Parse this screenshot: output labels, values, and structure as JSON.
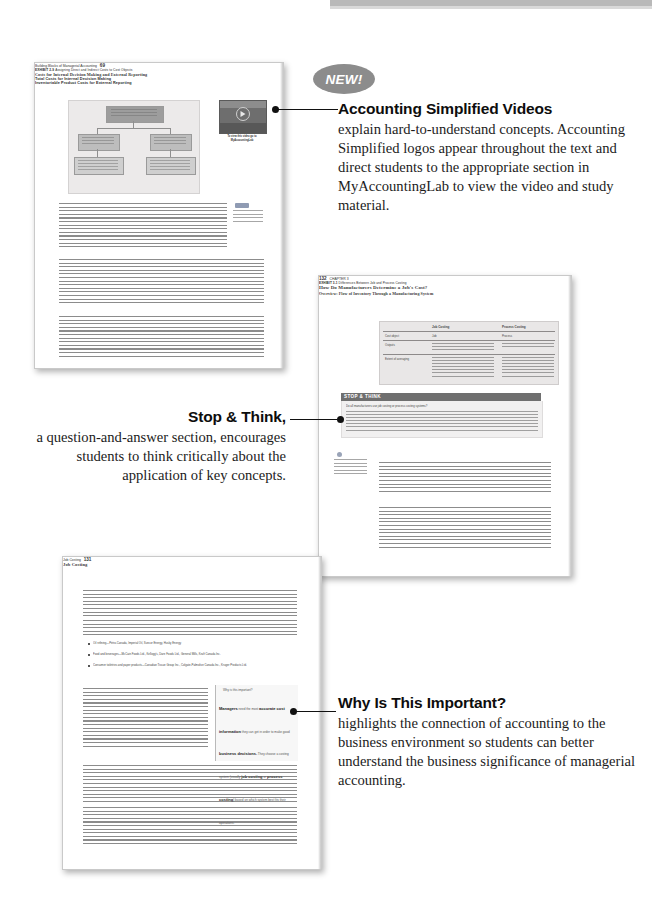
{
  "figure": {
    "kind": "textbook-feature-walkthrough",
    "badge": {
      "label": "NEW!"
    }
  },
  "annotations": [
    {
      "id": "accounting-simplified-videos",
      "title": "Accounting Simplified Videos",
      "body": "explain hard-to-understand concepts. Accounting Simplified logos appear throughout the text and direct students to the appropriate section in MyAccountingLab to view the video and study material.",
      "align": "left"
    },
    {
      "id": "stop-and-think",
      "title": "Stop & Think,",
      "body": "a question-and-answer section, encourages students to think critically about the application of key concepts.",
      "align": "right"
    },
    {
      "id": "why-is-this-important",
      "title": "Why Is This Important?",
      "body": "highlights the connection of accounting to the business environment so students can better understand the business significance of managerial accounting.",
      "align": "left"
    }
  ],
  "pages": [
    {
      "id": "page-top-left",
      "running_head": "Building Blocks of Managerial Accounting",
      "folio": "69",
      "exhibit": {
        "number": "EXHIBIT 2-9",
        "caption": "Assigning Direct and Indirect Costs to Cost Objects",
        "nodes": {
          "top": "Costs",
          "left": "Direct",
          "right": "Indirect",
          "left_detail": "Traced to cost object",
          "right_detail": "Allocated to cost object"
        }
      },
      "video_callout": {
        "thumbnail_title": "Accounting Simplified",
        "caption": "To view this video go to MyAccountingLab"
      },
      "headings": [
        "Costs for Internal Decision Making and External Reporting",
        "Total Costs for Internal Decision Making",
        "Inventoriable Product Costs for External Reporting"
      ],
      "margin_note": "Identify the costs of a manufacturing firm"
    },
    {
      "id": "page-middle-right",
      "folio": "132",
      "running_head": "CHAPTER 3",
      "exhibit": {
        "number": "EXHIBIT 3-1",
        "caption": "Differences Between Job and Process Costing",
        "columns": [
          "",
          "Job Costing",
          "Process Costing"
        ],
        "rows": [
          [
            "Cost object",
            "Job",
            "Process"
          ],
          [
            "Outputs",
            "Single units or small batches with large differences between jobs",
            "Large quantities of identical units"
          ],
          [
            "Extent of averaging",
            "Less averaging—costs are averaged over the small number of units in a job (often 1 unit in a job)",
            "More averaging—costs are averaged over the many identical units that pass through the process"
          ]
        ]
      },
      "stop_think": {
        "label": "STOP & THINK",
        "question": "Do all manufacturers use job costing or process costing systems?",
        "answer": "Answer: Some manufacturers use a hybrid of these two costing systems if neither \"pure\" system mirrors their production environment very well. For example, clothing manufacturers often create the same product over and over (process costing) but use different materials in different batches (job costing)."
      },
      "headings": [
        "How Do Manufacturers Determine a Job's Cost?",
        "Overview: Flow of Inventory Through a Manufacturing System"
      ],
      "learning_objective": "Understand the flow of production and how direct materials and direct labour are traced to jobs"
    },
    {
      "id": "page-bottom-left",
      "running_head": "Job Costing",
      "folio": "131",
      "headings": [
        "Job Costing"
      ],
      "bullets": [
        "Oil refining—Petro-Canada, Imperial Oil, Suncor Energy, Husky Energy",
        "Food and beverages—McCain Foods Ltd., Kellogg's, Dare Foods Ltd., General Mills, Kraft Canada Inc.",
        "Consumer toiletries and paper products—Canadian Tissue Group Inc., Colgate-Palmolive Canada Inc., Kruger Products Ltd."
      ],
      "callout": {
        "title": "Why is this important?",
        "text_segments": [
          {
            "text": "Managers",
            "emphasis": true
          },
          {
            "text": " need the most ",
            "emphasis": false
          },
          {
            "text": "accurate cost information",
            "emphasis": true
          },
          {
            "text": " they can get in order to make good ",
            "emphasis": false
          },
          {
            "text": "business decisions.",
            "emphasis": true
          },
          {
            "text": " They choose a costing system (usually ",
            "emphasis": false
          },
          {
            "text": "job costing",
            "emphasis": true
          },
          {
            "text": " or ",
            "emphasis": false
          },
          {
            "text": "process costing",
            "emphasis": true
          },
          {
            "text": ") based on which system best fits their operations.",
            "emphasis": false
          }
        ]
      }
    }
  ],
  "colors": {
    "badge_grey": "#8c8c8c",
    "leader_black": "#111111",
    "page_border": "#c9c9c9",
    "stop_think_bar": "#6f6f6f",
    "callout_bg": "#f7f7f7"
  }
}
